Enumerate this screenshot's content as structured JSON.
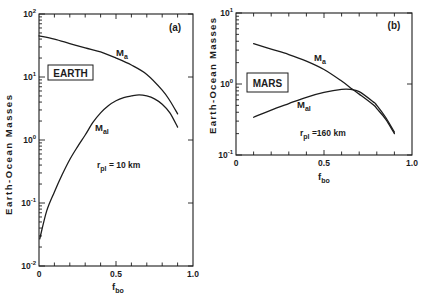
{
  "figure": {
    "panels": [
      {
        "panel_label": "(a)",
        "planet": "EARTH",
        "ylabel": "Earth-Ocean Masses",
        "xlabel": {
          "main": "f",
          "sub": "bo"
        },
        "series_labels": [
          {
            "main": "M",
            "sub": "a"
          },
          {
            "main": "M",
            "sub": "al"
          }
        ],
        "note": {
          "main": "r",
          "sub": "pl",
          "rest": " = 10 km"
        }
      },
      {
        "panel_label": "(b)",
        "planet": "MARS",
        "ylabel": "Earth-Ocean Masses",
        "xlabel": {
          "main": "f",
          "sub": "bo"
        },
        "series_labels": [
          {
            "main": "M",
            "sub": "a"
          },
          {
            "main": "M",
            "sub": "al"
          }
        ],
        "note": {
          "main": "r",
          "sub": "pl",
          "rest": " =160 km"
        }
      }
    ]
  },
  "chart_data": [
    {
      "type": "line",
      "title": "(a) EARTH",
      "annotation": "r_pl = 10 km",
      "xlabel": "f_bo",
      "ylabel": "Earth-Ocean Masses",
      "yscale": "log",
      "xlim": [
        0,
        1.0
      ],
      "ylim": [
        0.01,
        100
      ],
      "xticks": [
        "0",
        "0.5",
        "1.0"
      ],
      "yticks": [
        {
          "base": "10",
          "exp": "-2",
          "value": 0.01
        },
        {
          "base": "10",
          "exp": "-1",
          "value": 0.1
        },
        {
          "base": "10",
          "exp": "0",
          "value": 1
        },
        {
          "base": "10",
          "exp": "1",
          "value": 10
        },
        {
          "base": "10",
          "exp": "2",
          "value": 100
        }
      ],
      "grid": false,
      "legend": "inline labels",
      "series": [
        {
          "name": "M_a",
          "x": [
            0,
            0.1,
            0.2,
            0.3,
            0.4,
            0.5,
            0.6,
            0.7,
            0.8,
            0.85,
            0.9
          ],
          "values": [
            45,
            40,
            34,
            29,
            25,
            20,
            15.5,
            11,
            6.2,
            4.2,
            2.6
          ]
        },
        {
          "name": "M_al",
          "x": [
            0.005,
            0.05,
            0.1,
            0.15,
            0.2,
            0.25,
            0.3,
            0.35,
            0.4,
            0.45,
            0.5,
            0.55,
            0.6,
            0.65,
            0.7,
            0.75,
            0.8,
            0.85,
            0.9
          ],
          "values": [
            0.027,
            0.075,
            0.15,
            0.28,
            0.49,
            0.78,
            1.2,
            1.9,
            2.7,
            3.5,
            4.2,
            4.7,
            5.0,
            5.2,
            5.0,
            4.5,
            3.7,
            2.7,
            1.6
          ]
        }
      ]
    },
    {
      "type": "line",
      "title": "(b) MARS",
      "annotation": "r_pl = 160 km",
      "xlabel": "f_bo",
      "ylabel": "Earth-Ocean Masses",
      "yscale": "log",
      "xlim": [
        0,
        1.0
      ],
      "ylim": [
        0.1,
        10
      ],
      "xticks": [
        "0",
        "0.5",
        "1.0"
      ],
      "yticks": [
        {
          "base": "10",
          "exp": "-1",
          "value": 0.1
        },
        {
          "base": "10",
          "exp": "0",
          "value": 1
        },
        {
          "base": "10",
          "exp": "1",
          "value": 10
        }
      ],
      "grid": false,
      "legend": "inline labels",
      "series": [
        {
          "name": "M_a",
          "x": [
            0.1,
            0.2,
            0.3,
            0.4,
            0.5,
            0.6,
            0.66,
            0.7,
            0.78,
            0.8,
            0.85,
            0.9
          ],
          "values": [
            3.7,
            3.1,
            2.6,
            2.1,
            1.6,
            1.1,
            0.85,
            0.72,
            0.51,
            0.45,
            0.32,
            0.2
          ]
        },
        {
          "name": "M_al",
          "x": [
            0.1,
            0.2,
            0.3,
            0.4,
            0.5,
            0.6,
            0.65,
            0.7,
            0.78,
            0.8,
            0.85,
            0.9
          ],
          "values": [
            0.34,
            0.43,
            0.53,
            0.65,
            0.76,
            0.84,
            0.84,
            0.78,
            0.56,
            0.5,
            0.34,
            0.21
          ]
        }
      ]
    }
  ]
}
